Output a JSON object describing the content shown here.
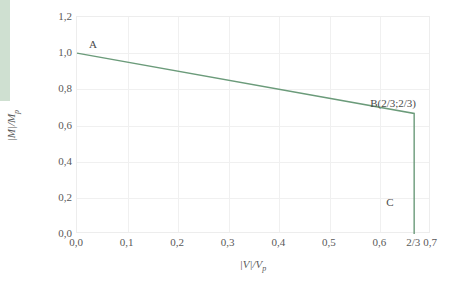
{
  "chart_data": {
    "type": "line",
    "title": "",
    "xlabel": "|V|/Vp",
    "ylabel": "|M|/Mp",
    "xlim": [
      0.0,
      0.7
    ],
    "ylim": [
      0.0,
      1.2
    ],
    "grid": true,
    "legend": "none",
    "x_ticks": [
      "0,0",
      "0,1",
      "0,2",
      "0,3",
      "0,4",
      "0,5",
      "0,6",
      "2/3",
      "0,7"
    ],
    "x_tick_values": [
      0.0,
      0.1,
      0.2,
      0.3,
      0.4,
      0.5,
      0.6,
      0.6667,
      0.7
    ],
    "y_ticks": [
      "0,0",
      "0,2",
      "0,4",
      "0,6",
      "0,8",
      "1,0",
      "1,2"
    ],
    "y_tick_values": [
      0.0,
      0.2,
      0.4,
      0.6,
      0.8,
      1.0,
      1.2
    ],
    "series": [
      {
        "name": "M-V interaction envelope",
        "color": "#6b9b7a",
        "x": [
          0.0,
          0.6667,
          0.6667
        ],
        "y": [
          1.0,
          0.6667,
          0.0
        ]
      }
    ],
    "annotations": [
      {
        "label": "A",
        "x": 0.0,
        "y": 1.0
      },
      {
        "label": "B(2/3;2/3)",
        "x": 0.6667,
        "y": 0.6667
      },
      {
        "label": "C",
        "x": 0.6667,
        "y": 0.0
      }
    ]
  },
  "axes": {
    "y_label_main": "|M|/M",
    "y_label_sub": "p",
    "x_label_main": "|V|/V",
    "x_label_sub": "p"
  },
  "annotations": {
    "a": "A",
    "b": "B(2/3;2/3)",
    "c": "C"
  },
  "colors": {
    "curve": "#6b9b7a",
    "grid": "#f0f0f0",
    "frame": "#ededed",
    "accent_bar": "#cfe0d1",
    "text": "#595959"
  }
}
